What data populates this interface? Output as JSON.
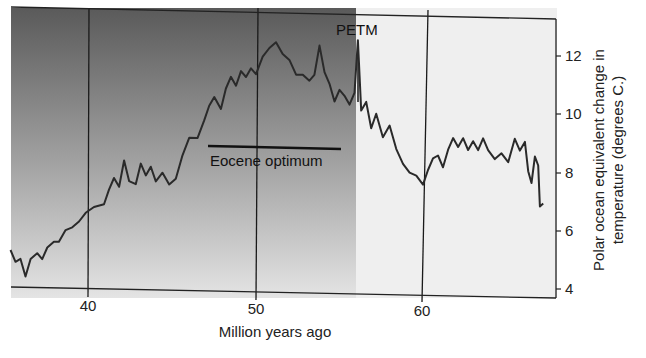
{
  "chart_data": {
    "type": "line",
    "title": "",
    "xlabel": "Million years ago",
    "ylabel": "Polar ocean equivalent change in temperature (degrees C.)",
    "ylabel_lines": [
      "Polar ocean equivalent change in",
      "temperature (degrees C.)"
    ],
    "xlim": [
      35.3,
      67.8
    ],
    "ylim": [
      3.8,
      13.2
    ],
    "x_ticks": [
      40,
      50,
      60
    ],
    "y_ticks": [
      4,
      6,
      8,
      10,
      12
    ],
    "grid": "vertical lines at 40, 50, 60",
    "y_axis_position": "right",
    "shaded_region": {
      "from": 35.3,
      "to": 56.0,
      "fill": "dark-to-light vertical gradient"
    },
    "annotations": [
      {
        "text": "PETM",
        "x": 56.1,
        "y": 12.6,
        "marker": "vertical line at ~56.1"
      },
      {
        "text": "Eocene optimum",
        "x_from": 47.3,
        "x_to": 55.0,
        "y": 8.9
      }
    ],
    "series": [
      {
        "name": "Polar ocean temperature change",
        "x": [
          35.3,
          35.6,
          35.9,
          36.2,
          36.5,
          36.9,
          37.2,
          37.5,
          37.9,
          38.2,
          38.6,
          39.0,
          39.4,
          39.8,
          40.3,
          40.9,
          41.2,
          41.5,
          41.8,
          42.1,
          42.4,
          42.8,
          43.1,
          43.4,
          43.7,
          44.0,
          44.4,
          44.8,
          45.2,
          45.6,
          46.0,
          46.5,
          46.9,
          47.2,
          47.5,
          47.9,
          48.2,
          48.5,
          48.8,
          49.1,
          49.4,
          49.7,
          50.0,
          50.4,
          50.8,
          51.2,
          51.6,
          52.0,
          52.4,
          52.8,
          53.2,
          53.5,
          53.8,
          54.1,
          54.4,
          54.7,
          55.0,
          55.3,
          55.6,
          55.9,
          56.1,
          56.3,
          56.6,
          56.9,
          57.2,
          57.6,
          58.0,
          58.4,
          58.8,
          59.2,
          59.6,
          60.0,
          60.3,
          60.6,
          60.9,
          61.2,
          61.5,
          61.8,
          62.1,
          62.4,
          62.7,
          63.0,
          63.3,
          63.6,
          63.9,
          64.3,
          64.7,
          65.1,
          65.5,
          65.8,
          66.1,
          66.3,
          66.5,
          66.7,
          66.9,
          67.0,
          67.2
        ],
        "y": [
          5.3,
          4.9,
          5.0,
          4.4,
          5.0,
          5.2,
          5.0,
          5.4,
          5.6,
          5.6,
          6.0,
          6.1,
          6.3,
          6.6,
          6.8,
          6.9,
          7.4,
          7.8,
          7.5,
          8.4,
          7.7,
          7.6,
          8.3,
          7.9,
          8.2,
          7.7,
          8.0,
          7.6,
          7.8,
          8.6,
          9.2,
          9.2,
          9.8,
          10.3,
          10.6,
          10.2,
          10.9,
          11.3,
          11.0,
          11.5,
          11.3,
          11.6,
          11.4,
          12.0,
          12.3,
          12.5,
          12.1,
          11.9,
          11.4,
          11.4,
          11.2,
          11.4,
          12.4,
          11.5,
          11.1,
          10.5,
          10.9,
          10.7,
          10.4,
          10.8,
          12.6,
          10.2,
          10.5,
          9.6,
          10.1,
          9.3,
          9.7,
          8.9,
          8.4,
          8.1,
          8.0,
          7.7,
          8.2,
          8.6,
          8.7,
          8.3,
          8.9,
          9.3,
          9.0,
          9.3,
          8.9,
          9.2,
          8.9,
          9.3,
          8.9,
          8.6,
          8.8,
          8.5,
          9.3,
          8.9,
          9.2,
          8.2,
          7.8,
          8.7,
          8.4,
          7.0,
          7.1
        ]
      }
    ]
  },
  "labels": {
    "x_axis_title": "Million years ago",
    "y_axis_title_line1": "Polar ocean equivalent change in",
    "y_axis_title_line2": "temperature (degrees C.)",
    "petm": "PETM",
    "eocene_optimum": "Eocene optimum",
    "x_tick_40": "40",
    "x_tick_50": "50",
    "x_tick_60": "60",
    "y_tick_4": "4",
    "y_tick_6": "6",
    "y_tick_8": "8",
    "y_tick_10": "10",
    "y_tick_12": "12"
  },
  "colors": {
    "shade_top": "#5a5a5a",
    "shade_bottom": "#e2e2e2",
    "plot_bg": "#efefef",
    "line": "#2a2a2a"
  }
}
